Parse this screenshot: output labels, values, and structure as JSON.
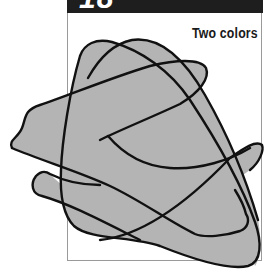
{
  "figure": {
    "header_number": "18",
    "caption": "Two colors",
    "colors": {
      "fill": "#b4b4b4",
      "outline": "#111111",
      "header_bar": "#1e1e1e",
      "frame_border": "#9a9a9a",
      "background": "#ffffff"
    },
    "shapes": [
      {
        "name": "rounded-triangle-shape"
      },
      {
        "name": "upper-lobe-shape"
      },
      {
        "name": "wavy-band-shape"
      },
      {
        "name": "lower-band-shape"
      }
    ]
  }
}
